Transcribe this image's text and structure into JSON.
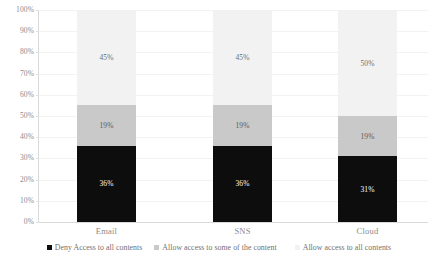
{
  "chart_data": {
    "type": "bar",
    "subtype": "100% stacked bar",
    "title": "",
    "xlabel": "",
    "ylabel": "",
    "ylim": [
      0,
      100
    ],
    "grid": true,
    "legend_position": "bottom",
    "categories": [
      "Email",
      "SNS",
      "Cloud"
    ],
    "y_ticks": [
      "0%",
      "10%",
      "20%",
      "30%",
      "40%",
      "50%",
      "60%",
      "70%",
      "80%",
      "90%",
      "100%"
    ],
    "y_tick_values": [
      0,
      10,
      20,
      30,
      40,
      50,
      60,
      70,
      80,
      90,
      100
    ],
    "series": [
      {
        "name": "Deny Access to all contents",
        "color": "#0d0d0d",
        "label_color": "#ffffff",
        "values": [
          36,
          36,
          31
        ],
        "labels": [
          "36%",
          "36%",
          "31%"
        ]
      },
      {
        "name": "Allow access to some of the content",
        "color": "#c9c9c9",
        "label_color": "#5a5a5a",
        "values": [
          19,
          19,
          19
        ],
        "labels": [
          "19%",
          "19%",
          "19%"
        ]
      },
      {
        "name": "Allow access to all contents",
        "color": "#f2f2f2",
        "label_color": "#6e6e6e",
        "values": [
          45,
          45,
          50
        ],
        "labels": [
          "45%",
          "45%",
          "50%"
        ]
      }
    ]
  },
  "legend": {
    "items": [
      {
        "label": "Deny Access to all contents",
        "color": "#0d0d0d"
      },
      {
        "label": "Allow access to some of the content",
        "color": "#c9c9c9"
      },
      {
        "label": "Allow access to all contents",
        "color": "#f2f2f2"
      }
    ]
  },
  "colors": {
    "axis": "#d9d9d9",
    "gridline": "#f2f2f2",
    "tick_text": "#8c8c8c",
    "background": "#ffffff"
  }
}
